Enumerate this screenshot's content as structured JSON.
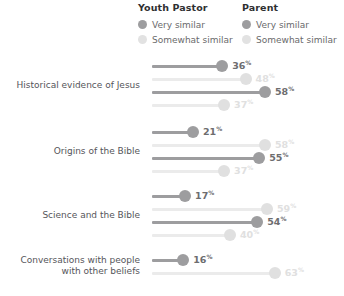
{
  "legend": {
    "groups": [
      {
        "title": "Youth Pastor",
        "items": [
          {
            "label": "Very similar",
            "key": "very",
            "color": "#9d9d9f"
          },
          {
            "label": "Somewhat similar",
            "key": "somewhat",
            "color": "#e2e2e2"
          }
        ]
      },
      {
        "title": "Parent",
        "items": [
          {
            "label": "Very similar",
            "key": "very",
            "color": "#9d9d9f"
          },
          {
            "label": "Somewhat similar",
            "key": "somewhat",
            "color": "#e2e2e2"
          }
        ]
      }
    ]
  },
  "chart_data": {
    "type": "bar",
    "title": "",
    "subtitle": "",
    "xlabel": "",
    "ylabel": "",
    "xlim": [
      0,
      70
    ],
    "grid": false,
    "legend_position": "top",
    "value_suffix": "%",
    "categories": [
      "Historical evidence of Jesus",
      "Origins of the Bible",
      "Science and the Bible",
      "Conversations with people with other beliefs"
    ],
    "series": [
      {
        "name": "Youth Pastor - Very similar",
        "group": "Youth Pastor",
        "style": "very",
        "values": [
          36,
          21,
          17,
          16
        ]
      },
      {
        "name": "Youth Pastor - Somewhat similar",
        "group": "Youth Pastor",
        "style": "somewhat",
        "values": [
          48,
          58,
          59,
          63
        ]
      },
      {
        "name": "Parent - Very similar",
        "group": "Parent",
        "style": "very",
        "values": [
          58,
          55,
          54,
          null
        ]
      },
      {
        "name": "Parent - Somewhat similar",
        "group": "Parent",
        "style": "somewhat",
        "values": [
          37,
          37,
          40,
          null
        ]
      }
    ],
    "rows": [
      {
        "label_line1": "Historical evidence of Jesus",
        "label_line2": "",
        "bars": [
          {
            "style": "very",
            "value": 36,
            "display": "36"
          },
          {
            "style": "somewhat",
            "value": 48,
            "display": "48"
          },
          {
            "style": "very",
            "value": 58,
            "display": "58"
          },
          {
            "style": "somewhat",
            "value": 37,
            "display": "37"
          }
        ]
      },
      {
        "label_line1": "Origins of the Bible",
        "label_line2": "",
        "bars": [
          {
            "style": "very",
            "value": 21,
            "display": "21"
          },
          {
            "style": "somewhat",
            "value": 58,
            "display": "58"
          },
          {
            "style": "very",
            "value": 55,
            "display": "55"
          },
          {
            "style": "somewhat",
            "value": 37,
            "display": "37"
          }
        ]
      },
      {
        "label_line1": "Science and the Bible",
        "label_line2": "",
        "bars": [
          {
            "style": "very",
            "value": 17,
            "display": "17"
          },
          {
            "style": "somewhat",
            "value": 59,
            "display": "59"
          },
          {
            "style": "very",
            "value": 54,
            "display": "54"
          },
          {
            "style": "somewhat",
            "value": 40,
            "display": "40"
          }
        ]
      },
      {
        "label_line1": "Conversations with people",
        "label_line2": "with other beliefs",
        "bars": [
          {
            "style": "very",
            "value": 16,
            "display": "16"
          },
          {
            "style": "somewhat",
            "value": 63,
            "display": "63"
          }
        ]
      }
    ]
  }
}
